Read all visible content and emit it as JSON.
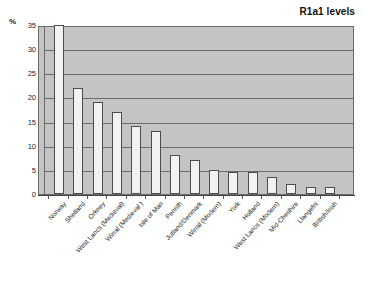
{
  "chart": {
    "title": "R1a1 levels",
    "y_axis_unit": "%",
    "y_ticks": [
      "35",
      "30",
      "25",
      "20",
      "15",
      "10",
      "5",
      "0"
    ]
  },
  "chart_data": {
    "type": "bar",
    "title": "R1a1 levels",
    "xlabel": "",
    "ylabel": "%",
    "ylim": [
      0,
      35
    ],
    "ytick_step": 5,
    "grid": true,
    "legend": "none",
    "categories": [
      "Norway",
      "Shetland",
      "Orkney",
      "West Lancs (Medieval)",
      "Wirral (Medieval )",
      "Isle of Man",
      "Penrith",
      "Jutland/Denmark",
      "Wirral (Modern)",
      "York",
      "Holland",
      "West Lancs (Modern)",
      "Mid-Cheshire",
      "Llangefni",
      "British/Irish"
    ],
    "values": [
      35,
      22,
      19,
      17,
      14,
      13,
      8,
      7,
      5,
      4.5,
      4.5,
      3.5,
      2,
      1.5,
      1.5
    ],
    "plot_background": "#c4c4c4",
    "bar_fill": "#f2f2f2",
    "bar_edge": "#4d4d4d",
    "gridline_color": "#6b6b6b"
  }
}
